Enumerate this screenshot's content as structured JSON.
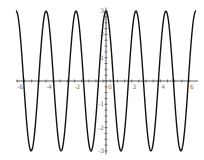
{
  "chart_data": {
    "type": "line",
    "title": "",
    "xlabel": "",
    "ylabel": "",
    "function": "y = 3cos(3x)",
    "xlim": [
      -6.3,
      6.3
    ],
    "ylim": [
      -3,
      3
    ],
    "grid": false,
    "legend": null,
    "x_ticks": [
      "-6",
      "-4",
      "-2",
      "0",
      "2",
      "4",
      "6"
    ],
    "y_ticks": [
      "-3",
      "-2",
      "-1",
      "1",
      "2",
      "3"
    ],
    "series": [
      {
        "name": "3cos(3x)",
        "color": "#111111",
        "amplitude": 3,
        "angular_frequency": 3
      }
    ]
  },
  "colors": {
    "curve": "#111111",
    "axis": "#333333",
    "label": "#777777"
  }
}
